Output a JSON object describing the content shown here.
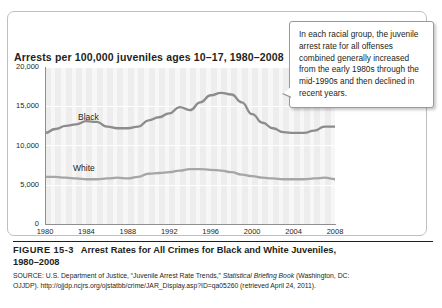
{
  "figure": {
    "number": "FIGURE 15-3",
    "caption_line1": "Arrest Rates for All Crimes for Black and White Juveniles,",
    "caption_line2": "1980–2008",
    "source_line1": "SOURCE: U.S. Department of Justice, “Juvenile Arrest Rate Trends,” ",
    "source_italic": "Statistical Briefing Book",
    "source_line1_end": " (Washington, DC:",
    "source_line2": "OJJDP). http://ojjdp.ncjrs.org/ojstatbb/crime/JAR_Display.asp?ID=qa05260 (retrieved April 24, 2011)."
  },
  "callout": {
    "text": "In each racial group, the juvenile arrest rate for all offenses combined generally increased from the early 1980s through the mid-1990s and then declined in recent years."
  },
  "chart_data": {
    "type": "line",
    "title": "Arrests per 100,000 juveniles ages 10–17, 1980–2008",
    "xlabel": "",
    "ylabel": "",
    "xlim": [
      1980,
      2008
    ],
    "ylim": [
      0,
      20000
    ],
    "grid": true,
    "legend_position": "inline-on-series",
    "ytick_labels": [
      "0",
      "5,000",
      "10,000",
      "15,000",
      "20,000"
    ],
    "ytick_values": [
      0,
      5000,
      10000,
      15000,
      20000
    ],
    "xtick_labels": [
      "1980",
      "1984",
      "1988",
      "1992",
      "1996",
      "2000",
      "2004",
      "2008"
    ],
    "xtick_values": [
      1980,
      1984,
      1988,
      1992,
      1996,
      2000,
      2004,
      2008
    ],
    "x": [
      1980,
      1981,
      1982,
      1983,
      1984,
      1985,
      1986,
      1987,
      1988,
      1989,
      1990,
      1991,
      1992,
      1993,
      1994,
      1995,
      1996,
      1997,
      1998,
      1999,
      2000,
      2001,
      2002,
      2003,
      2004,
      2005,
      2006,
      2007,
      2008
    ],
    "series": [
      {
        "name": "Black",
        "color": "#8c8c8c",
        "values": [
          11600,
          12100,
          12500,
          12700,
          13100,
          13000,
          12400,
          12200,
          12200,
          12400,
          13200,
          13600,
          14100,
          14900,
          14500,
          15500,
          16400,
          16700,
          16500,
          15500,
          14000,
          12900,
          12200,
          11700,
          11600,
          11600,
          11900,
          12400,
          12400
        ]
      },
      {
        "name": "White",
        "color": "#a6a6a6",
        "values": [
          6000,
          6000,
          5900,
          5800,
          5700,
          5700,
          5800,
          5900,
          5800,
          6000,
          6400,
          6500,
          6600,
          6800,
          7000,
          7000,
          6900,
          6800,
          6600,
          6300,
          6100,
          5900,
          5800,
          5700,
          5700,
          5700,
          5800,
          5900,
          5700
        ]
      }
    ],
    "series_label_black": "Black",
    "series_label_white": "White"
  }
}
